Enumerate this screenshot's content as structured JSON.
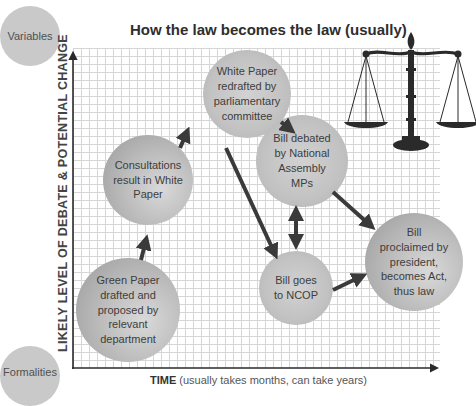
{
  "title": "How the law becomes the law (usually)",
  "legend": {
    "top": "Variables",
    "bottom": "Formalities"
  },
  "axes": {
    "y_label": "LIKELY LEVEL OF DEBATE & POTENTIAL CHANGE",
    "x_label_bold": "TIME",
    "x_label_rest": " (usually takes months, can take years)"
  },
  "nodes": [
    {
      "id": "green-paper",
      "label": "Green Paper drafted and proposed by relevant department"
    },
    {
      "id": "consultations",
      "label": "Consultations result in White Paper"
    },
    {
      "id": "white-paper",
      "label": "White Paper redrafted by parliamentary committee"
    },
    {
      "id": "bill-debated",
      "label": "Bill debated by National Assembly MPs"
    },
    {
      "id": "bill-ncop",
      "label": "Bill goes to NCOP"
    },
    {
      "id": "bill-proclaimed",
      "label": "Bill proclaimed by president, becomes Act, thus law"
    }
  ],
  "edges": [
    {
      "from": "green-paper",
      "to": "consultations"
    },
    {
      "from": "consultations",
      "to": "white-paper"
    },
    {
      "from": "white-paper",
      "to": "bill-debated"
    },
    {
      "from": "white-paper",
      "to": "bill-ncop"
    },
    {
      "from": "bill-debated",
      "to": "bill-ncop",
      "bidirectional": true
    },
    {
      "from": "bill-debated",
      "to": "bill-proclaimed"
    },
    {
      "from": "bill-ncop",
      "to": "bill-proclaimed"
    }
  ],
  "illustration": "scales-of-justice-icon",
  "colors": {
    "arrow": "#3a3a3a",
    "grid": "#d6d6d6",
    "node_fill": "#bdbdbd"
  }
}
